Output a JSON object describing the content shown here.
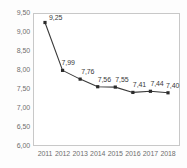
{
  "chart_data": {
    "type": "line",
    "title": "",
    "subtitle": "",
    "xlabel": "",
    "ylabel": "",
    "categories": [
      "2011",
      "2012",
      "2013",
      "2014",
      "2015",
      "2016",
      "2017",
      "2018"
    ],
    "values": [
      9.25,
      7.99,
      7.76,
      7.56,
      7.55,
      7.41,
      7.44,
      7.4
    ],
    "point_labels": [
      "9,25",
      "7,99",
      "7,76",
      "7,56",
      "7,55",
      "7,41",
      "7,44",
      "7,40"
    ],
    "series": [
      {
        "name": "",
        "values": [
          9.25,
          7.99,
          7.76,
          7.56,
          7.55,
          7.41,
          7.44,
          7.4
        ]
      }
    ],
    "ylim": [
      6.0,
      9.5
    ],
    "ytick_values": [
      9.5,
      9.0,
      8.5,
      8.0,
      7.5,
      7.0,
      6.5,
      6.0
    ],
    "ytick_labels": [
      "9,50",
      "9,00",
      "8,50",
      "8,00",
      "7,50",
      "7,00",
      "6,50",
      "6,00"
    ],
    "grid": false,
    "legend": "none",
    "decimal_separator": ",",
    "colors": {
      "line": "#3a3a3a",
      "marker": "#2b2b2b",
      "axis": "#c8c8c8",
      "tick_text": "#6f6f6f",
      "label_text": "#3a3a3a",
      "plot_background": "#ffffff",
      "figure_background": "#fdfdfd"
    }
  }
}
